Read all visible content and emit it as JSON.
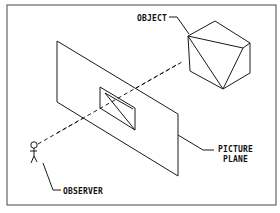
{
  "diagram": {
    "type": "perspective-projection-illustration",
    "labels": {
      "object": "OBJECT",
      "picture_plane_line1": "PICTURE",
      "picture_plane_line2": "PLANE",
      "observer": "OBSERVER"
    },
    "elements": [
      {
        "name": "object",
        "shape": "isometric hexagonal prism with triangular face"
      },
      {
        "name": "picture-plane",
        "shape": "parallelogram"
      },
      {
        "name": "projected-image",
        "shape": "small parallelogram with diagonal lines on picture plane"
      },
      {
        "name": "line-of-sight",
        "shape": "dashed line from observer to object"
      },
      {
        "name": "observer",
        "shape": "stick figure"
      }
    ],
    "colors": {
      "line": "#1a1a1a",
      "frame": "#555555",
      "background": "#ffffff"
    }
  }
}
